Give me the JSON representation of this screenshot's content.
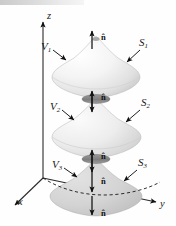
{
  "figure": {
    "kind": "3d-vector-calculus-diagram",
    "background_color": "#fefefe",
    "surface_fill_light": "#f0f0f0",
    "surface_fill_mid": "#d8d8d8",
    "surface_fill_dark": "#bdbdbd",
    "disk_color": "#8c8c8c",
    "line_color": "#1a1a1a"
  },
  "axes": {
    "z": {
      "label": "z",
      "x": 47,
      "y": 11
    },
    "y": {
      "label": "y",
      "x": 160,
      "y": 205
    },
    "x": {
      "label": "x",
      "x": 18,
      "y": 203
    },
    "origin": {
      "x": 43,
      "y": 178
    }
  },
  "volumes": [
    {
      "name": "volume-1",
      "label": "V",
      "sub": "1",
      "x": 41,
      "y": 45
    },
    {
      "name": "volume-2",
      "label": "V",
      "sub": "2",
      "x": 50,
      "y": 105
    },
    {
      "name": "volume-3",
      "label": "V",
      "sub": "3",
      "x": 52,
      "y": 163
    }
  ],
  "surfaces": [
    {
      "name": "surface-1",
      "label": "S",
      "sub": "1",
      "x": 139,
      "y": 41
    },
    {
      "name": "surface-2",
      "label": "S",
      "sub": "2",
      "x": 141,
      "y": 101
    },
    {
      "name": "surface-3",
      "label": "S",
      "sub": "3",
      "x": 139,
      "y": 161
    }
  ],
  "normals": [
    {
      "name": "normal-top-s1",
      "label": "n̂",
      "x": 101,
      "y": 36,
      "direction": "up"
    },
    {
      "name": "normal-mid-upper",
      "label": "n̂",
      "x": 101,
      "y": 96,
      "direction": "up"
    },
    {
      "name": "normal-mid-lower",
      "label": "n̂",
      "x": 101,
      "y": 155,
      "direction": "up"
    },
    {
      "name": "normal-inner-s3",
      "label": "n̂",
      "x": 101,
      "y": 180,
      "direction": "down"
    },
    {
      "name": "normal-bottom-s3",
      "label": "n̂",
      "x": 101,
      "y": 212,
      "direction": "down"
    }
  ]
}
